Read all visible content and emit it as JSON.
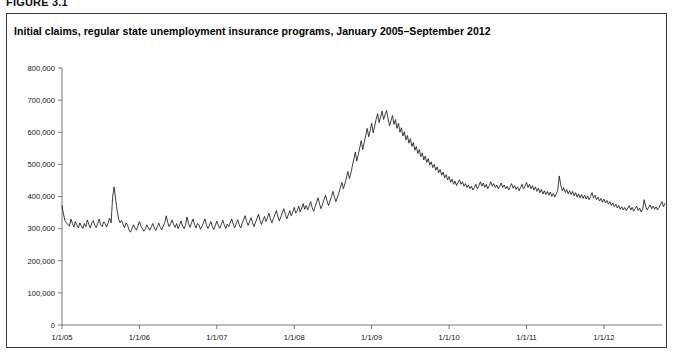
{
  "figure": {
    "label": "FIGURE 3.1"
  },
  "title": "Initial claims, regular state unemployment insurance programs, January 2005–September 2012",
  "chart_data": {
    "type": "line",
    "title": "Initial claims, regular state unemployment insurance programs, January 2005–September 2012",
    "xlabel": "",
    "ylabel": "",
    "ylim": [
      0,
      800000
    ],
    "ytick_labels": [
      "0",
      "100,000",
      "200,000",
      "300,000",
      "400,000",
      "500,000",
      "600,000",
      "700,000",
      "800,000"
    ],
    "ytick_values": [
      0,
      100000,
      200000,
      300000,
      400000,
      500000,
      600000,
      700000,
      800000
    ],
    "xtick_labels": [
      "1/1/05",
      "1/1/06",
      "1/1/07",
      "1/1/08",
      "1/1/09",
      "1/1/10",
      "1/1/11",
      "1/1/12"
    ],
    "xtick_values": [
      2005.0,
      2006.0,
      2007.0,
      2008.0,
      2009.0,
      2010.0,
      2011.0,
      2012.0
    ],
    "xlim": [
      2005.0,
      2012.75
    ],
    "grid": false,
    "legend": false,
    "series": [
      {
        "name": "Initial claims, regular state UI programs",
        "color": "#1a1a1a",
        "x_start": 2005.0,
        "x_step": 0.019230769,
        "values": [
          372000,
          345000,
          325000,
          318000,
          312000,
          308000,
          330000,
          316000,
          305000,
          322000,
          311000,
          302000,
          318000,
          308000,
          300000,
          316000,
          306000,
          327000,
          313000,
          302000,
          318000,
          325000,
          310000,
          303000,
          316000,
          330000,
          312000,
          306000,
          321000,
          315000,
          305000,
          318000,
          333000,
          318000,
          398000,
          430000,
          392000,
          358000,
          330000,
          318000,
          326000,
          312000,
          303000,
          318000,
          311000,
          296000,
          289000,
          300000,
          312000,
          302000,
          295000,
          308000,
          322000,
          308000,
          300000,
          292000,
          300000,
          312000,
          303000,
          295000,
          306000,
          316000,
          302000,
          294000,
          306000,
          317000,
          304000,
          296000,
          308000,
          318000,
          340000,
          320000,
          306000,
          316000,
          327000,
          312000,
          304000,
          316000,
          300000,
          311000,
          324000,
          308000,
          300000,
          312000,
          336000,
          316000,
          304000,
          318000,
          330000,
          314000,
          302000,
          316000,
          312000,
          298000,
          307000,
          318000,
          330000,
          312000,
          300000,
          311000,
          322000,
          306000,
          297000,
          310000,
          324000,
          310000,
          301000,
          313000,
          326000,
          312000,
          300000,
          314000,
          306000,
          318000,
          330000,
          314000,
          303000,
          316000,
          328000,
          312000,
          302000,
          316000,
          328000,
          340000,
          322000,
          310000,
          322000,
          334000,
          318000,
          306000,
          320000,
          332000,
          345000,
          326000,
          313000,
          326000,
          338000,
          322000,
          334000,
          348000,
          330000,
          318000,
          331000,
          344000,
          356000,
          338000,
          324000,
          337000,
          350000,
          362000,
          344000,
          330000,
          343000,
          356000,
          340000,
          352000,
          366000,
          348000,
          356000,
          370000,
          352000,
          364000,
          378000,
          360000,
          372000,
          358000,
          370000,
          384000,
          366000,
          354000,
          368000,
          382000,
          396000,
          376000,
          362000,
          376000,
          390000,
          404000,
          386000,
          372000,
          386000,
          400000,
          416000,
          398000,
          384000,
          398000,
          412000,
          428000,
          444000,
          424000,
          440000,
          458000,
          478000,
          456000,
          472000,
          494000,
          516000,
          538000,
          510000,
          530000,
          552000,
          574000,
          546000,
          568000,
          590000,
          612000,
          586000,
          606000,
          628000,
          598000,
          618000,
          640000,
          658000,
          630000,
          648000,
          666000,
          640000,
          655000,
          668000,
          642000,
          620000,
          636000,
          652000,
          624000,
          640000,
          612000,
          628000,
          600000,
          614000,
          588000,
          602000,
          576000,
          590000,
          566000,
          580000,
          556000,
          568000,
          544000,
          556000,
          534000,
          546000,
          524000,
          536000,
          514000,
          526000,
          506000,
          518000,
          498000,
          508000,
          490000,
          500000,
          482000,
          492000,
          474000,
          484000,
          466000,
          476000,
          458000,
          468000,
          452000,
          462000,
          444000,
          454000,
          438000,
          448000,
          434000,
          444000,
          452000,
          438000,
          446000,
          432000,
          440000,
          428000,
          436000,
          424000,
          432000,
          420000,
          428000,
          438000,
          424000,
          434000,
          446000,
          432000,
          442000,
          428000,
          438000,
          424000,
          434000,
          446000,
          432000,
          440000,
          428000,
          436000,
          424000,
          432000,
          442000,
          428000,
          436000,
          424000,
          432000,
          420000,
          430000,
          440000,
          426000,
          434000,
          422000,
          430000,
          418000,
          428000,
          438000,
          424000,
          432000,
          444000,
          428000,
          438000,
          424000,
          434000,
          420000,
          430000,
          416000,
          426000,
          412000,
          422000,
          408000,
          418000,
          406000,
          416000,
          404000,
          414000,
          400000,
          410000,
          398000,
          408000,
          420000,
          464000,
          436000,
          418000,
          428000,
          412000,
          422000,
          408000,
          418000,
          406000,
          416000,
          402000,
          412000,
          398000,
          408000,
          396000,
          406000,
          394000,
          404000,
          392000,
          402000,
          390000,
          400000,
          412000,
          396000,
          404000,
          390000,
          398000,
          386000,
          394000,
          382000,
          392000,
          380000,
          388000,
          376000,
          384000,
          372000,
          380000,
          368000,
          376000,
          364000,
          372000,
          360000,
          368000,
          358000,
          366000,
          356000,
          364000,
          372000,
          358000,
          366000,
          354000,
          362000,
          370000,
          356000,
          364000,
          352000,
          360000,
          390000,
          370000,
          358000,
          366000,
          374000,
          362000,
          370000,
          360000,
          368000,
          358000,
          366000,
          376000,
          384000,
          368000,
          378000
        ]
      }
    ]
  },
  "axes": {
    "plot_left_px": 62,
    "plot_right_px": 662,
    "plot_top_px": 68,
    "plot_bottom_px": 325
  }
}
